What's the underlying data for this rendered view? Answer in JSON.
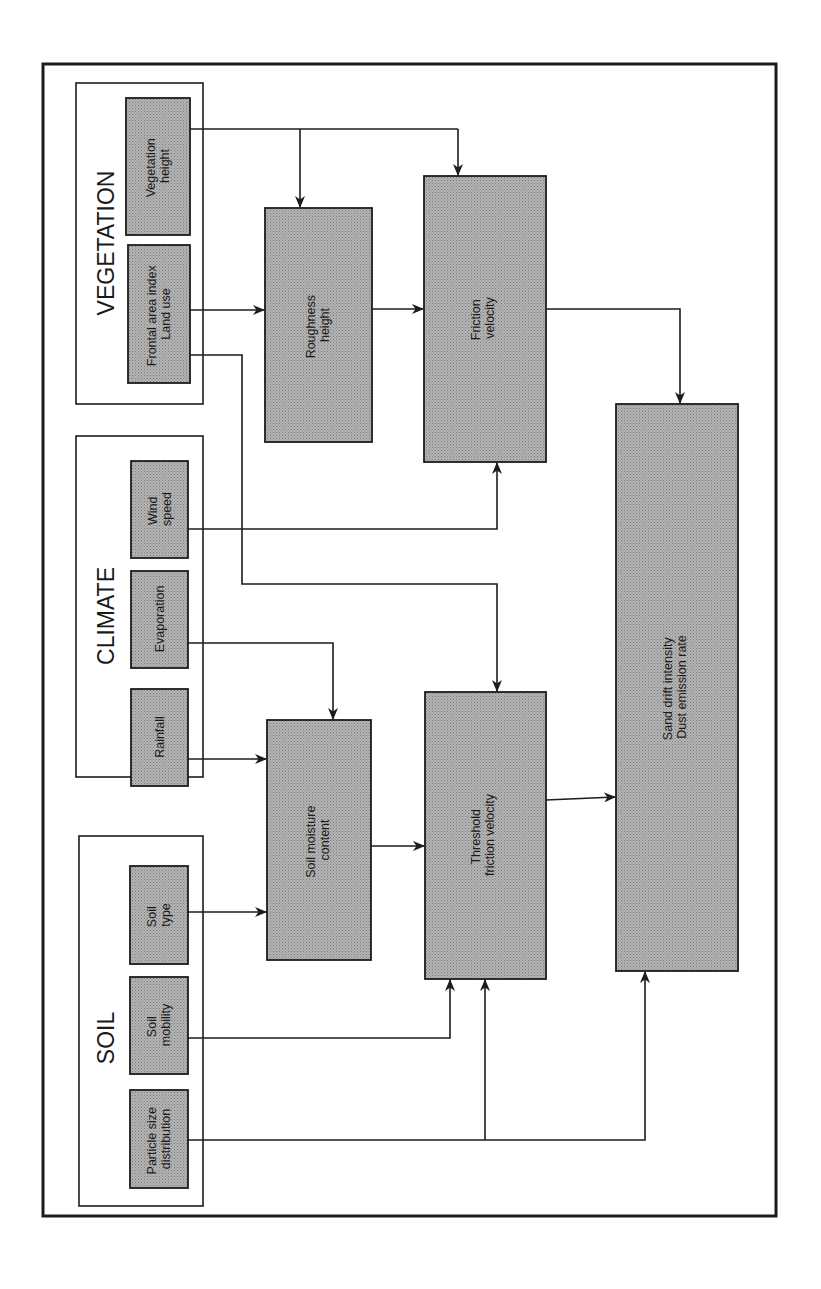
{
  "diagram": {
    "orientation": "rotated-90-counterclockwise",
    "colors": {
      "box_fill": "#a9a9a9",
      "box_stroke": "#1c1c1c",
      "line": "#1c1c1c",
      "background": "#ffffff"
    },
    "groups": {
      "vegetation": {
        "title": "VEGETATION",
        "inputs": {
          "vegetation_height": {
            "line1": "Vegetation",
            "line2": "height"
          },
          "frontal_area": {
            "line1": "Frontal area index",
            "line2": "Land use"
          }
        }
      },
      "climate": {
        "title": "CLIMATE",
        "inputs": {
          "wind_speed": {
            "line1": "Wind",
            "line2": "speed"
          },
          "evaporation": {
            "line1": "Evaporation"
          },
          "rainfall": {
            "line1": "Rainfall"
          }
        }
      },
      "soil": {
        "title": "SOIL",
        "inputs": {
          "soil_type": {
            "line1": "Soil",
            "line2": "type"
          },
          "soil_mobility": {
            "line1": "Soil",
            "line2": "mobility"
          },
          "particle_size": {
            "line1": "Particle size",
            "line2": "distribution"
          }
        }
      }
    },
    "processes": {
      "roughness_height": {
        "line1": "Roughness",
        "line2": "height"
      },
      "friction_velocity": {
        "line1": "Friction",
        "line2": "velocity"
      },
      "soil_moisture": {
        "line1": "Soil moisture",
        "line2": "content"
      },
      "threshold_friction_velocity": {
        "line1": "Threshold",
        "line2": "friction velocity"
      },
      "output": {
        "line1": "Sand drift intensity",
        "line2": "Dust emission rate"
      }
    },
    "edges": [
      {
        "from": "Vegetation height",
        "to": "Roughness height"
      },
      {
        "from": "Vegetation height",
        "to": "Friction velocity"
      },
      {
        "from": "Frontal area index / Land use",
        "to": "Roughness height"
      },
      {
        "from": "Frontal area index / Land use",
        "to": "Threshold friction velocity"
      },
      {
        "from": "Roughness height",
        "to": "Friction velocity"
      },
      {
        "from": "Friction velocity",
        "to": "Sand drift intensity / Dust emission rate"
      },
      {
        "from": "Wind speed",
        "to": "Friction velocity"
      },
      {
        "from": "Evaporation",
        "to": "Soil moisture content"
      },
      {
        "from": "Rainfall",
        "to": "Soil moisture content"
      },
      {
        "from": "Soil type",
        "to": "Soil moisture content"
      },
      {
        "from": "Soil moisture content",
        "to": "Threshold friction velocity"
      },
      {
        "from": "Soil mobility",
        "to": "Threshold friction velocity"
      },
      {
        "from": "Particle size distribution",
        "to": "Threshold friction velocity"
      },
      {
        "from": "Particle size distribution",
        "to": "Sand drift intensity / Dust emission rate"
      },
      {
        "from": "Threshold friction velocity",
        "to": "Sand drift intensity / Dust emission rate"
      }
    ]
  }
}
